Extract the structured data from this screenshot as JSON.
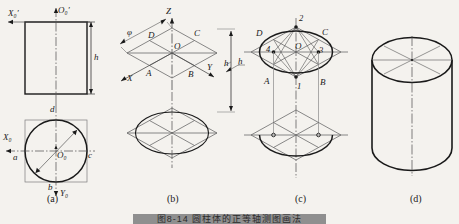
{
  "figure": {
    "title_bar_text": "图8-14  圆柱体的正等轴测图画法",
    "panels": [
      {
        "id": "a",
        "caption": "(a)",
        "description": "两视图",
        "labels": [
          {
            "text": "X₀′",
            "x": 10,
            "y": 14
          },
          {
            "text": "O₀′",
            "x": 58,
            "y": 11
          },
          {
            "text": "h",
            "x": 93,
            "y": 57
          },
          {
            "text": "d",
            "x": 49,
            "y": 110
          },
          {
            "text": "X₀",
            "x": 4,
            "y": 133
          },
          {
            "text": "a",
            "x": 14,
            "y": 155
          },
          {
            "text": "c",
            "x": 87,
            "y": 152
          },
          {
            "text": "O₀",
            "x": 54,
            "y": 152
          },
          {
            "text": "b",
            "x": 47,
            "y": 188
          },
          {
            "text": "Y₀",
            "x": 61,
            "y": 192
          }
        ]
      },
      {
        "id": "b",
        "caption": "(b)",
        "description": "画轴测轴及菱形",
        "labels": [
          {
            "text": "Z",
            "x": 166,
            "y": 12
          },
          {
            "text": "φ",
            "x": 128,
            "y": 33
          },
          {
            "text": "D",
            "x": 148,
            "y": 35
          },
          {
            "text": "C",
            "x": 193,
            "y": 33
          },
          {
            "text": "O",
            "x": 172,
            "y": 48
          },
          {
            "text": "X",
            "x": 129,
            "y": 73
          },
          {
            "text": "A",
            "x": 146,
            "y": 70
          },
          {
            "text": "B",
            "x": 186,
            "y": 71
          },
          {
            "text": "Y",
            "x": 206,
            "y": 67
          },
          {
            "text": "h",
            "x": 228,
            "y": 66
          }
        ]
      },
      {
        "id": "c",
        "caption": "(c)",
        "description": "四心法作椭圆",
        "labels": [
          {
            "text": "h",
            "x": 235,
            "y": 63
          },
          {
            "text": "2",
            "x": 296,
            "y": 20
          },
          {
            "text": "D",
            "x": 257,
            "y": 33
          },
          {
            "text": "C",
            "x": 320,
            "y": 32
          },
          {
            "text": "4",
            "x": 267,
            "y": 52
          },
          {
            "text": "O",
            "x": 294,
            "y": 48
          },
          {
            "text": "3",
            "x": 318,
            "y": 53
          },
          {
            "text": "A",
            "x": 265,
            "y": 81
          },
          {
            "text": "1",
            "x": 296,
            "y": 90
          },
          {
            "text": "B",
            "x": 318,
            "y": 82
          }
        ]
      },
      {
        "id": "d",
        "caption": "(d)",
        "description": "完成的圆柱轴测图",
        "labels": []
      }
    ],
    "captions": [
      {
        "text": "(a)",
        "x": 49,
        "y": 200
      },
      {
        "text": "(b)",
        "x": 169,
        "y": 200
      },
      {
        "text": "(c)",
        "x": 297,
        "y": 200
      },
      {
        "text": "(d)",
        "x": 412,
        "y": 200
      }
    ]
  },
  "colors": {
    "background": "#f4f2ee",
    "line": "#1a1a1a",
    "thin_line": "#555555",
    "center_line": "#4a4a4a",
    "bar": "#8f8f8f"
  }
}
